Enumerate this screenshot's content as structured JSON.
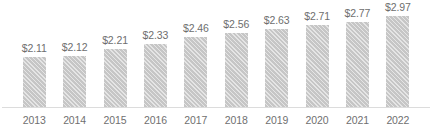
{
  "chart_data": {
    "type": "bar",
    "title": "",
    "subtitle": "",
    "xlabel": "",
    "ylabel": "",
    "grid": false,
    "legend": false,
    "legend_position": "none",
    "axis_baseline_value": 1.7,
    "ylim": [
      1.7,
      3.05
    ],
    "categories": [
      "2013",
      "2014",
      "2015",
      "2016",
      "2017",
      "2018",
      "2019",
      "2020",
      "2021",
      "2022"
    ],
    "values": [
      2.11,
      2.12,
      2.21,
      2.33,
      2.46,
      2.56,
      2.63,
      2.71,
      2.77,
      2.97
    ],
    "data_labels": [
      "$2.11",
      "$2.12",
      "$2.21",
      "$2.33",
      "$2.46",
      "$2.56",
      "$2.63",
      "$2.71",
      "$2.77",
      "$2.97"
    ],
    "bar_color": "#c6c6c6",
    "bar_pattern": "diagonal-hatch",
    "label_color": "#6e6e6e",
    "category_color": "#707070",
    "axis_color": "#dcdcdc",
    "background_color": "#ffffff"
  },
  "bars": [
    {
      "category": "2013",
      "value": 2.11,
      "label": "$2.11",
      "bar_height_px": 51
    },
    {
      "category": "2014",
      "value": 2.12,
      "label": "$2.12",
      "bar_height_px": 52
    },
    {
      "category": "2015",
      "value": 2.21,
      "label": "$2.21",
      "bar_height_px": 59
    },
    {
      "category": "2016",
      "value": 2.33,
      "label": "$2.33",
      "bar_height_px": 64
    },
    {
      "category": "2017",
      "value": 2.46,
      "label": "$2.46",
      "bar_height_px": 71
    },
    {
      "category": "2018",
      "value": 2.56,
      "label": "$2.56",
      "bar_height_px": 75
    },
    {
      "category": "2019",
      "value": 2.63,
      "label": "$2.63",
      "bar_height_px": 79
    },
    {
      "category": "2020",
      "value": 2.71,
      "label": "$2.71",
      "bar_height_px": 83
    },
    {
      "category": "2021",
      "value": 2.77,
      "label": "$2.77",
      "bar_height_px": 86
    },
    {
      "category": "2022",
      "value": 2.97,
      "label": "$2.97",
      "bar_height_px": 92
    }
  ]
}
